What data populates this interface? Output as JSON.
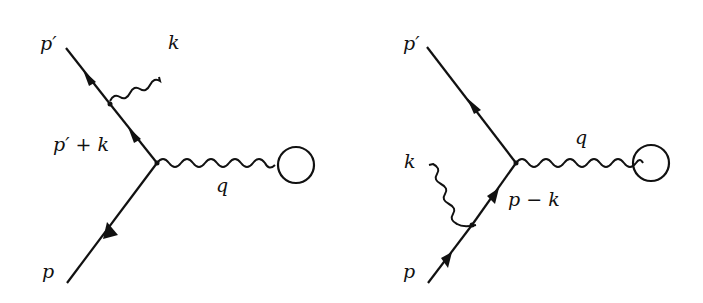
{
  "diagrams": [
    {
      "id": "left",
      "labels": {
        "p_out": "p′",
        "photon_emitted": "k",
        "internal": "p′ + k",
        "exchange": "q",
        "p_in": "p"
      }
    },
    {
      "id": "right",
      "labels": {
        "p_out": "p′",
        "photon_emitted": "k",
        "internal": "p − k",
        "exchange": "q",
        "p_in": "p"
      }
    }
  ],
  "colors": {
    "line": "#111111",
    "background": "#ffffff"
  }
}
